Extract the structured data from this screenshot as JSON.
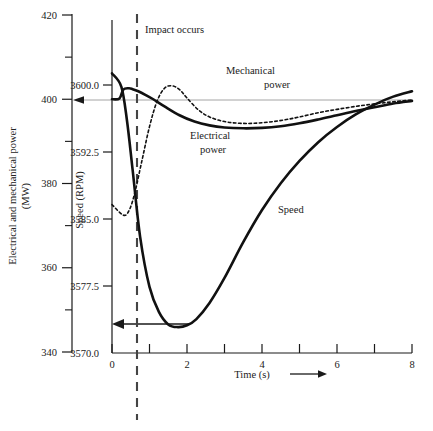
{
  "chart_data": {
    "type": "line",
    "title": "",
    "subtitle": "",
    "xlabel": "Time (s)",
    "xlim": [
      0,
      8
    ],
    "x_ticks_major": [
      0,
      2,
      4,
      6,
      8
    ],
    "x_ticks_minor": [
      1,
      3,
      5,
      7
    ],
    "x_tick_labels": [
      "0",
      "2",
      "4",
      "6",
      "8"
    ],
    "grid": false,
    "legend_position": "inline-annotations",
    "axes": [
      {
        "id": "power",
        "label_line1": "Electrical and mechanical power",
        "label_line2": "(MW)",
        "ylim": [
          340,
          420
        ],
        "ticks": [
          420,
          400,
          380,
          360,
          340
        ],
        "tick_labels": [
          "420",
          "400",
          "380",
          "360",
          "340"
        ],
        "minor_ticks": [
          410,
          390,
          370,
          350
        ]
      },
      {
        "id": "speed",
        "label": "Speed (RPM)",
        "ylim": [
          3570.0,
          3602.5
        ],
        "ticks": [
          3600.0,
          3592.5,
          3585.0,
          3577.5,
          3570.0
        ],
        "tick_labels": [
          "3600.0",
          "3592.5",
          "3585.0",
          "3577.5",
          "3570.0"
        ]
      }
    ],
    "annotations": [
      {
        "name": "impact-occurs",
        "text": "Impact occurs",
        "x": 0.45,
        "kind": "vertical-dashed-line"
      },
      {
        "name": "mechanical-power-label",
        "line1": "Mechanical",
        "line2": "power"
      },
      {
        "name": "electrical-power-label",
        "line1": "Electrical",
        "line2": "power"
      },
      {
        "name": "speed-label",
        "line1": "Speed"
      },
      {
        "name": "power-reference-arrow",
        "text": "",
        "value": 400,
        "axis": "power",
        "kind": "horizontal-arrow-to-left-axis"
      },
      {
        "name": "speed-minimum-arrow",
        "text": "",
        "value": 3572.9,
        "axis": "speed",
        "kind": "horizontal-arrow-to-speed-axis"
      },
      {
        "name": "time-axis-arrow",
        "text": "",
        "kind": "right-arrow"
      }
    ],
    "series": [
      {
        "name": "Electrical power",
        "axis": "power",
        "style": "solid",
        "unit": "MW",
        "x": [
          0.0,
          0.2,
          0.3,
          0.45,
          0.55,
          0.7,
          0.9,
          1.1,
          1.4,
          1.8,
          2.2,
          2.6,
          3.0,
          3.5,
          4.0,
          4.5,
          5.0,
          5.5,
          6.0,
          6.5,
          7.0,
          7.5,
          8.0
        ],
        "y": [
          400.0,
          400.2,
          402.3,
          402.6,
          402.4,
          401.9,
          401.0,
          400.0,
          398.3,
          396.2,
          394.7,
          393.8,
          393.3,
          393.1,
          393.2,
          393.6,
          394.3,
          395.2,
          396.2,
          397.2,
          398.1,
          399.0,
          399.6
        ]
      },
      {
        "name": "Mechanical power",
        "axis": "power",
        "style": "dotted",
        "unit": "MW",
        "x": [
          0.0,
          0.3,
          0.45,
          0.6,
          0.8,
          1.0,
          1.2,
          1.4,
          1.6,
          1.8,
          2.0,
          2.3,
          2.6,
          3.0,
          3.4,
          3.8,
          4.2,
          4.6,
          5.0,
          5.5,
          6.0,
          6.5,
          7.0,
          7.5,
          8.0
        ],
        "y": [
          375.0,
          372.5,
          373.5,
          377.5,
          385.5,
          393.5,
          399.5,
          402.6,
          403.2,
          402.3,
          400.3,
          397.5,
          395.8,
          394.7,
          394.3,
          394.3,
          394.6,
          395.1,
          395.8,
          396.8,
          397.6,
          398.3,
          398.9,
          399.4,
          399.8
        ]
      },
      {
        "name": "Speed",
        "axis": "speed",
        "style": "solid",
        "unit": "RPM",
        "x": [
          0.0,
          0.25,
          0.4,
          0.55,
          0.75,
          1.0,
          1.25,
          1.5,
          1.75,
          2.0,
          2.25,
          2.6,
          3.0,
          3.5,
          4.0,
          4.5,
          5.0,
          5.5,
          6.0,
          6.5,
          7.0,
          7.5,
          8.0
        ],
        "y": [
          3601.3,
          3599.8,
          3596.0,
          3590.5,
          3583.0,
          3577.4,
          3574.6,
          3573.2,
          3572.9,
          3573.1,
          3573.8,
          3575.6,
          3578.4,
          3582.4,
          3586.0,
          3589.0,
          3591.5,
          3593.6,
          3595.3,
          3596.7,
          3597.8,
          3598.7,
          3599.3
        ]
      }
    ]
  }
}
